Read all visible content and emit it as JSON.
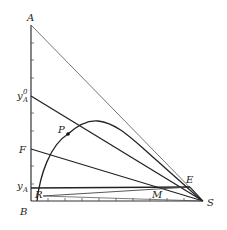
{
  "diagram": {
    "type": "ternary-phase-diagram-right-triangle",
    "vertices": {
      "A": "A",
      "B": "B",
      "S": "S"
    },
    "labels": {
      "A": "A",
      "B": "B",
      "S": "S",
      "yA0_main": "y",
      "yA0_sub": "A",
      "yA0_sup": "0",
      "F": "F",
      "yA_main": "y",
      "yA_sub": "A",
      "P": "P",
      "R": "R",
      "M": "M",
      "E": "E"
    },
    "elements": [
      "solubility curve (binodal) from near B through R, P, peak, to near S",
      "hypotenuse A–S",
      "line y_A^0–S",
      "line F–S",
      "horizontal line at y_A to E",
      "tie/operating line R–M–E",
      "plait point P"
    ],
    "axis_ticks": {
      "left_count": 8,
      "bottom_count": 9
    }
  }
}
